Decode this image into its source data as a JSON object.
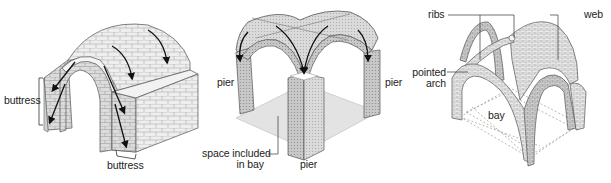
{
  "figure": {
    "panels": [
      {
        "id": "barrel-vault",
        "labels": {
          "buttress_left": "buttress",
          "buttress_bottom": "buttress"
        }
      },
      {
        "id": "groin-vault",
        "labels": {
          "pier_left": "pier",
          "pier_right": "pier",
          "pier_bottom": "pier",
          "space_line1": "space included",
          "space_line2": "in bay"
        }
      },
      {
        "id": "rib-vault",
        "labels": {
          "ribs": "ribs",
          "web": "web",
          "pointed_line1": "pointed",
          "pointed_line2": "arch",
          "bay": "bay"
        }
      }
    ],
    "colors": {
      "stone_light": "#f0f0f0",
      "stone_mid": "#d6d6d6",
      "stone_dark": "#b4b4b4",
      "outline": "#555555",
      "arrow": "#111111",
      "floor": "#e2e2e2",
      "dashed": "#9a9a9a"
    }
  }
}
